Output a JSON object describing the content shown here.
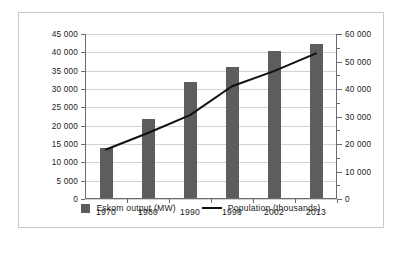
{
  "chart_data": {
    "type": "bar",
    "title": "",
    "subtitle": "",
    "xlabel": "",
    "ylabel": "",
    "grid": true,
    "legend_position": "bottom",
    "categories": [
      "1970",
      "1980",
      "1990",
      "1996",
      "2002",
      "2013"
    ],
    "series": [
      {
        "name": "Eskom output (MW)",
        "type": "bar",
        "axis": "left",
        "color": "#5d5d5d",
        "values": [
          13800,
          21900,
          32000,
          36000,
          40500,
          42200
        ]
      },
      {
        "name": "Population (thousands)",
        "type": "line",
        "axis": "right",
        "color": "#111111",
        "values": [
          18000,
          24000,
          30500,
          41000,
          46500,
          53000
        ]
      }
    ],
    "left_axis": {
      "label": "",
      "ylim": [
        0,
        45000
      ],
      "step": 5000,
      "ticks": [
        0,
        5000,
        10000,
        15000,
        20000,
        25000,
        30000,
        35000,
        40000,
        45000
      ],
      "tick_labels": [
        "0",
        "5 000",
        "10 000",
        "15 000",
        "20 000",
        "25 000",
        "30 000",
        "35 000",
        "40 000",
        "45 000"
      ]
    },
    "right_axis": {
      "label": "",
      "ylim": [
        0,
        60000
      ],
      "step": 10000,
      "minor_step": 5000,
      "ticks": [
        0,
        10000,
        20000,
        30000,
        40000,
        50000,
        60000
      ],
      "tick_labels": [
        "0",
        "10 000",
        "20 000",
        "30 000",
        "40 000",
        "50 000",
        "60 000"
      ]
    }
  },
  "legend": {
    "items": [
      {
        "label": "Eskom output (MW)",
        "marker": "bar-swatch"
      },
      {
        "label": "Population (thousands)",
        "marker": "line-swatch"
      }
    ]
  }
}
